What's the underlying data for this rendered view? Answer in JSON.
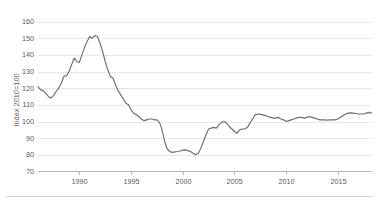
{
  "chart_data": {
    "type": "line",
    "title": "",
    "subtitle": "",
    "xlabel": "",
    "ylabel": "Index 2010=100",
    "xlim": [
      1986,
      2018.3
    ],
    "ylim": [
      70,
      162
    ],
    "yticks": [
      70,
      80,
      90,
      100,
      110,
      120,
      130,
      140,
      150,
      160
    ],
    "ytick_labels": [
      "70",
      "80",
      "90",
      "100",
      "110",
      "120",
      "130",
      "140",
      "150",
      "160"
    ],
    "xticks": [
      1990,
      1995,
      2000,
      2005,
      2010,
      2015
    ],
    "xtick_labels": [
      "1990",
      "1995",
      "2000",
      "2005",
      "2010",
      "2015"
    ],
    "grid": "horizontal",
    "legend": "none",
    "legend_position": "none",
    "line_color": "#6e6e70",
    "grid_color": "#d9d9d9",
    "axis_color": "#9a9a9a",
    "text_color": "#58585a",
    "background_color": "#ffffff",
    "series": [
      {
        "name": "Index 2010=100",
        "x": [
          1986.0,
          1986.25,
          1986.5,
          1986.75,
          1987.0,
          1987.25,
          1987.5,
          1987.75,
          1988.0,
          1988.25,
          1988.5,
          1988.75,
          1989.0,
          1989.25,
          1989.5,
          1989.75,
          1990.0,
          1990.25,
          1990.5,
          1990.75,
          1991.0,
          1991.25,
          1991.5,
          1991.75,
          1992.0,
          1992.25,
          1992.5,
          1992.75,
          1993.0,
          1993.25,
          1993.5,
          1993.75,
          1994.0,
          1994.25,
          1994.5,
          1994.75,
          1995.0,
          1995.25,
          1995.5,
          1995.75,
          1996.0,
          1996.25,
          1996.5,
          1996.75,
          1997.0,
          1997.25,
          1997.5,
          1997.75,
          1998.0,
          1998.25,
          1998.5,
          1998.75,
          1999.0,
          1999.25,
          1999.5,
          1999.75,
          2000.0,
          2000.25,
          2000.5,
          2000.75,
          2001.0,
          2001.25,
          2001.5,
          2001.75,
          2002.0,
          2002.25,
          2002.5,
          2002.75,
          2003.0,
          2003.25,
          2003.5,
          2003.75,
          2004.0,
          2004.25,
          2004.5,
          2004.75,
          2005.0,
          2005.25,
          2005.5,
          2005.75,
          2006.0,
          2006.25,
          2006.5,
          2006.75,
          2007.0,
          2007.25,
          2007.5,
          2007.75,
          2008.0,
          2008.25,
          2008.5,
          2008.75,
          2009.0,
          2009.25,
          2009.5,
          2009.75,
          2010.0,
          2010.25,
          2010.5,
          2010.75,
          2011.0,
          2011.25,
          2011.5,
          2011.75,
          2012.0,
          2012.25,
          2012.5,
          2012.75,
          2013.0,
          2013.25,
          2013.5,
          2013.75,
          2014.0,
          2014.25,
          2014.5,
          2014.75,
          2015.0,
          2015.25,
          2015.5,
          2015.75,
          2016.0,
          2016.25,
          2016.5,
          2016.75,
          2017.0,
          2017.25,
          2017.5,
          2017.75,
          2018.0,
          2018.25
        ],
        "values": [
          121.0,
          119.0,
          118.5,
          117.0,
          115.0,
          114.0,
          115.5,
          118.0,
          120.0,
          123.0,
          127.0,
          127.5,
          130.0,
          134.0,
          138.0,
          136.0,
          135.5,
          140.0,
          144.5,
          148.0,
          151.0,
          150.0,
          151.5,
          151.0,
          147.0,
          142.0,
          136.0,
          131.0,
          127.0,
          126.0,
          122.0,
          118.5,
          116.0,
          113.5,
          111.0,
          110.0,
          107.0,
          105.0,
          104.0,
          103.0,
          101.5,
          100.5,
          101.0,
          101.5,
          101.5,
          101.0,
          101.0,
          99.5,
          95.0,
          88.0,
          83.5,
          82.0,
          81.5,
          81.8,
          82.0,
          82.3,
          82.8,
          83.0,
          82.5,
          82.0,
          81.0,
          80.0,
          81.0,
          84.0,
          88.0,
          92.0,
          95.5,
          96.0,
          96.5,
          96.0,
          98.0,
          99.5,
          100.0,
          99.0,
          97.0,
          95.5,
          94.0,
          93.0,
          95.0,
          95.5,
          95.5,
          96.5,
          99.0,
          101.5,
          104.0,
          104.5,
          104.3,
          104.0,
          103.5,
          103.0,
          102.5,
          102.0,
          102.0,
          102.5,
          101.5,
          101.0,
          100.0,
          100.5,
          101.0,
          101.5,
          102.0,
          102.5,
          102.5,
          102.0,
          102.5,
          103.0,
          102.5,
          102.0,
          101.5,
          101.0,
          101.0,
          101.0,
          100.8,
          101.0,
          101.0,
          101.0,
          101.5,
          102.5,
          103.5,
          104.5,
          105.0,
          105.2,
          105.0,
          104.8,
          104.5,
          104.5,
          104.5,
          105.0,
          105.5,
          105.0
        ]
      }
    ],
    "annotations": []
  },
  "figure": {
    "footer_rule": true
  }
}
